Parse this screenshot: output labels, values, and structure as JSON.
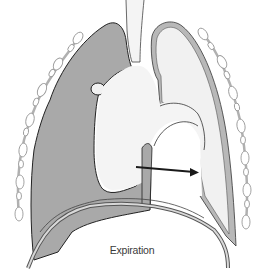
{
  "figure": {
    "caption": "Expiration",
    "colors": {
      "background": "#ffffff",
      "affected_lung_fill": "#a9a9a9",
      "normal_lung_fill": "#f1f1f1",
      "pleura_band": "#b8b8b8",
      "outline": "#333333",
      "rib_fill": "#ffffff",
      "rib_stroke": "#9a9a9a",
      "arrow": "#1a1a1a"
    },
    "elements": [
      {
        "name": "trachea",
        "description": "airway tube at top center"
      },
      {
        "name": "left-lung-shaded",
        "description": "hyperinflated dark gray lung on viewer's left"
      },
      {
        "name": "right-lung-light",
        "description": "light lung outline on viewer's right with pleural band"
      },
      {
        "name": "mediastinum",
        "description": "central white mediastinal region with heart shape"
      },
      {
        "name": "mediastinal-shift-arrow",
        "description": "arrow pointing right indicating mediastinal shift"
      },
      {
        "name": "diaphragm",
        "description": "double-line dome diaphragm at bottom"
      },
      {
        "name": "rib-chain-left",
        "description": "chain of rib cross-sections along left chest wall"
      },
      {
        "name": "rib-chain-right",
        "description": "chain of rib cross-sections along right chest wall"
      }
    ]
  }
}
